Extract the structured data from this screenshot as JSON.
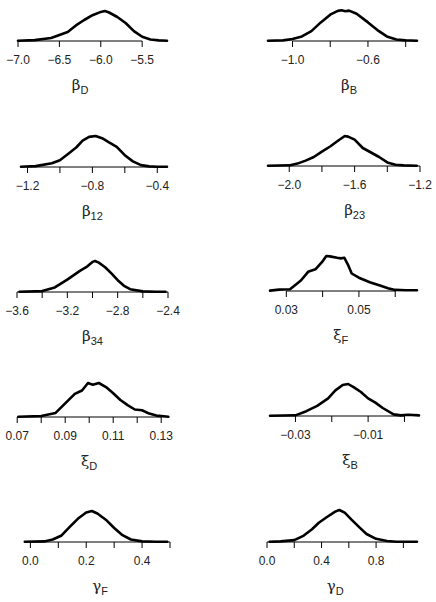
{
  "chart_data": [
    {
      "type": "line",
      "title": "",
      "xlabel": "βD",
      "xlabel_symbol": "β",
      "xlabel_subscript": "D",
      "ylabel": "",
      "xlim": [
        -7.0,
        -5.2
      ],
      "ticks": [
        -7.0,
        -6.5,
        -6.0,
        -5.5
      ],
      "tick_labels": [
        "−7.0",
        "−6.5",
        "−6.0",
        "−5.5"
      ],
      "x": [
        -7.0,
        -6.8,
        -6.6,
        -6.5,
        -6.4,
        -6.3,
        -6.2,
        -6.1,
        -6.0,
        -5.95,
        -5.9,
        -5.8,
        -5.7,
        -5.6,
        -5.5,
        -5.4,
        -5.3,
        -5.2
      ],
      "y": [
        0.01,
        0.03,
        0.1,
        0.2,
        0.3,
        0.52,
        0.7,
        0.86,
        0.97,
        1.0,
        0.95,
        0.8,
        0.6,
        0.33,
        0.14,
        0.05,
        0.02,
        0.01
      ]
    },
    {
      "type": "line",
      "xlabel": "βB",
      "xlabel_symbol": "β",
      "xlabel_subscript": "B",
      "xlim": [
        -1.13,
        -0.34
      ],
      "ticks": [
        -1.0,
        -0.8,
        -0.6,
        -0.4
      ],
      "tick_labels": [
        "−1.0",
        "",
        "−0.6",
        ""
      ],
      "x": [
        -1.13,
        -1.05,
        -1.0,
        -0.95,
        -0.9,
        -0.85,
        -0.8,
        -0.76,
        -0.74,
        -0.72,
        -0.7,
        -0.66,
        -0.6,
        -0.55,
        -0.5,
        -0.45,
        -0.4,
        -0.34
      ],
      "y": [
        0.01,
        0.02,
        0.06,
        0.15,
        0.32,
        0.6,
        0.85,
        0.97,
        0.99,
        0.96,
        0.98,
        0.88,
        0.6,
        0.35,
        0.15,
        0.05,
        0.02,
        0.01
      ]
    },
    {
      "type": "line",
      "xlabel": "β12",
      "xlabel_symbol": "β",
      "xlabel_subscript": "12",
      "xlim": [
        -1.24,
        -0.34
      ],
      "ticks": [
        -1.2,
        -1.0,
        -0.8,
        -0.6,
        -0.4
      ],
      "tick_labels": [
        "−1.2",
        "",
        "−0.8",
        "",
        "−0.4"
      ],
      "x": [
        -1.24,
        -1.15,
        -1.05,
        -1.0,
        -0.95,
        -0.9,
        -0.86,
        -0.82,
        -0.78,
        -0.74,
        -0.7,
        -0.65,
        -0.6,
        -0.55,
        -0.5,
        -0.45,
        -0.4,
        -0.34
      ],
      "y": [
        0.01,
        0.03,
        0.12,
        0.22,
        0.42,
        0.63,
        0.85,
        0.97,
        1.0,
        0.93,
        0.8,
        0.65,
        0.38,
        0.18,
        0.06,
        0.02,
        0.01,
        0.01
      ]
    },
    {
      "type": "line",
      "xlabel": "β23",
      "xlabel_symbol": "β",
      "xlabel_subscript": "23",
      "xlim": [
        -2.13,
        -1.2
      ],
      "ticks": [
        -2.0,
        -1.8,
        -1.6,
        -1.4,
        -1.2
      ],
      "tick_labels": [
        "−2.0",
        "",
        "−1.6",
        "",
        "−1.2"
      ],
      "x": [
        -2.13,
        -2.0,
        -1.95,
        -1.9,
        -1.85,
        -1.8,
        -1.75,
        -1.7,
        -1.66,
        -1.64,
        -1.6,
        -1.55,
        -1.5,
        -1.45,
        -1.4,
        -1.35,
        -1.3,
        -1.22
      ],
      "y": [
        0.01,
        0.02,
        0.08,
        0.18,
        0.3,
        0.48,
        0.65,
        0.85,
        1.0,
        0.98,
        0.88,
        0.6,
        0.45,
        0.3,
        0.12,
        0.04,
        0.02,
        0.01
      ]
    },
    {
      "type": "line",
      "xlabel": "β34",
      "xlabel_symbol": "β",
      "xlabel_subscript": "34",
      "xlim": [
        -3.6,
        -2.4
      ],
      "ticks": [
        -3.6,
        -3.4,
        -3.2,
        -3.0,
        -2.8,
        -2.6,
        -2.4
      ],
      "tick_labels": [
        "−3.6",
        "",
        "−3.2",
        "",
        "−2.8",
        "",
        "−2.4"
      ],
      "x": [
        -3.58,
        -3.4,
        -3.3,
        -3.2,
        -3.1,
        -3.05,
        -3.0,
        -2.98,
        -2.95,
        -2.9,
        -2.85,
        -2.8,
        -2.75,
        -2.7,
        -2.6,
        -2.5,
        -2.42
      ],
      "y": [
        0.01,
        0.03,
        0.15,
        0.4,
        0.68,
        0.8,
        0.97,
        1.0,
        0.95,
        0.8,
        0.6,
        0.38,
        0.2,
        0.09,
        0.02,
        0.01,
        0.01
      ]
    },
    {
      "type": "line",
      "xlabel": "ξF",
      "xlabel_symbol": "ξ",
      "xlabel_subscript": "F",
      "xlim": [
        0.0255,
        0.066
      ],
      "ticks": [
        0.03,
        0.04,
        0.05,
        0.06
      ],
      "tick_labels": [
        "0.03",
        "",
        "0.05",
        ""
      ],
      "x": [
        0.0255,
        0.028,
        0.031,
        0.034,
        0.036,
        0.038,
        0.04,
        0.041,
        0.042,
        0.044,
        0.045,
        0.046,
        0.047,
        0.048,
        0.05,
        0.053,
        0.056,
        0.058,
        0.06,
        0.063,
        0.066
      ],
      "y": [
        0.01,
        0.04,
        0.05,
        0.3,
        0.55,
        0.62,
        0.85,
        1.0,
        0.99,
        0.95,
        0.93,
        0.95,
        0.75,
        0.5,
        0.38,
        0.25,
        0.15,
        0.08,
        0.03,
        0.02,
        0.02
      ]
    },
    {
      "type": "line",
      "xlabel": "ξD",
      "xlabel_symbol": "ξ",
      "xlabel_subscript": "D",
      "xlim": [
        0.0695,
        0.1345
      ],
      "ticks": [
        0.07,
        0.08,
        0.09,
        0.1,
        0.11,
        0.12,
        0.13
      ],
      "tick_labels": [
        "0.07",
        "",
        "0.09",
        "",
        "0.11",
        "",
        "0.13"
      ],
      "x": [
        0.0705,
        0.08,
        0.086,
        0.09,
        0.094,
        0.097,
        0.0995,
        0.1015,
        0.104,
        0.107,
        0.11,
        0.113,
        0.116,
        0.119,
        0.122,
        0.125,
        0.128,
        0.133
      ],
      "y": [
        0.01,
        0.03,
        0.12,
        0.4,
        0.68,
        0.78,
        1.0,
        0.95,
        1.0,
        0.88,
        0.7,
        0.5,
        0.35,
        0.22,
        0.2,
        0.1,
        0.04,
        0.01
      ]
    },
    {
      "type": "line",
      "xlabel": "ξB",
      "xlabel_symbol": "ξ",
      "xlabel_subscript": "B",
      "xlim": [
        -0.037,
        0.004
      ],
      "ticks": [
        -0.03,
        -0.02,
        -0.01,
        0.0
      ],
      "tick_labels": [
        "−0.03",
        "",
        "−0.01",
        ""
      ],
      "x": [
        -0.037,
        -0.03,
        -0.027,
        -0.024,
        -0.021,
        -0.019,
        -0.017,
        -0.0155,
        -0.014,
        -0.012,
        -0.01,
        -0.008,
        -0.006,
        -0.003,
        -0.001,
        0.001,
        0.004
      ],
      "y": [
        0.01,
        0.02,
        0.15,
        0.32,
        0.55,
        0.8,
        0.97,
        1.0,
        0.9,
        0.75,
        0.55,
        0.42,
        0.25,
        0.05,
        0.02,
        0.04,
        0.02
      ]
    },
    {
      "type": "line",
      "xlabel": "γF",
      "xlabel_symbol": "γ",
      "xlabel_subscript": "F",
      "xlim": [
        -0.03,
        0.5
      ],
      "ticks": [
        0.0,
        0.1,
        0.2,
        0.3,
        0.4,
        0.5
      ],
      "tick_labels": [
        "0.0",
        "",
        "0.2",
        "",
        "0.4",
        ""
      ],
      "x": [
        -0.02,
        0.05,
        0.08,
        0.11,
        0.14,
        0.17,
        0.2,
        0.22,
        0.24,
        0.27,
        0.3,
        0.33,
        0.36,
        0.4,
        0.45,
        0.49
      ],
      "y": [
        0.01,
        0.02,
        0.08,
        0.2,
        0.48,
        0.75,
        0.95,
        1.0,
        0.92,
        0.72,
        0.45,
        0.22,
        0.08,
        0.02,
        0.01,
        0.01
      ]
    },
    {
      "type": "line",
      "xlabel": "γD",
      "xlabel_symbol": "γ",
      "xlabel_subscript": "D",
      "xlim": [
        0.0,
        1.1
      ],
      "ticks": [
        0.0,
        0.2,
        0.4,
        0.6,
        0.8,
        1.0
      ],
      "tick_labels": [
        "0.0",
        "",
        "0.4",
        "",
        "0.8",
        ""
      ],
      "x": [
        0.02,
        0.1,
        0.2,
        0.27,
        0.33,
        0.38,
        0.44,
        0.5,
        0.53,
        0.57,
        0.62,
        0.68,
        0.73,
        0.8,
        0.88,
        0.95,
        1.1
      ],
      "y": [
        0.01,
        0.02,
        0.06,
        0.2,
        0.4,
        0.6,
        0.78,
        0.95,
        1.0,
        0.92,
        0.7,
        0.45,
        0.25,
        0.1,
        0.03,
        0.01,
        0.01
      ]
    }
  ]
}
